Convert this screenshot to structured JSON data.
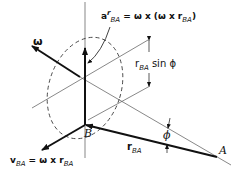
{
  "diagram": {
    "labels": {
      "omega": "ω",
      "accel_symbol": "a",
      "accel_sup": "r",
      "accel_sub": "BA",
      "accel_rhs": "= ω x (ω x r",
      "accel_rhs_sub": "BA",
      "accel_close": ")",
      "radius_r": "r",
      "radius_sub": "BA",
      "radius_sin": "sin ϕ",
      "point_B": "B",
      "point_A": "A",
      "phi": "ϕ",
      "rba_r": "r",
      "rba_sub": "BA",
      "vel_v": "v",
      "vel_sub": "BA",
      "vel_rhs": "= ω x r",
      "vel_rhs_sub": "BA"
    }
  }
}
